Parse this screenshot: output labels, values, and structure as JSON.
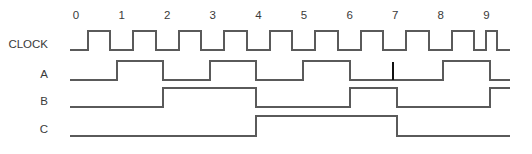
{
  "diagram": {
    "kind": "timing-waveform",
    "stroke_color": "#5a5a5a",
    "text_color": "#3a3a3a",
    "glitch_color": "#111111",
    "background_color": "#ffffff"
  },
  "time_axis": {
    "labels": [
      "0",
      "1",
      "2",
      "3",
      "4",
      "5",
      "6",
      "7",
      "8",
      "9"
    ],
    "label_y": 19,
    "origin_x": 76,
    "tick_spacing_px": 45.6
  },
  "signals": [
    {
      "name": "CLOCK",
      "label": "CLOCK",
      "label_x": 48,
      "label_y": 48,
      "baseline_y": 50,
      "high_y": 31,
      "start_x": 70,
      "end_x": 510,
      "initial_level": 0,
      "transitions": [
        {
          "x": 88,
          "level": 1
        },
        {
          "x": 110,
          "level": 0
        },
        {
          "x": 133,
          "level": 1
        },
        {
          "x": 156,
          "level": 0
        },
        {
          "x": 179,
          "level": 1
        },
        {
          "x": 201,
          "level": 0
        },
        {
          "x": 224,
          "level": 1
        },
        {
          "x": 247,
          "level": 0
        },
        {
          "x": 270,
          "level": 1
        },
        {
          "x": 292,
          "level": 0
        },
        {
          "x": 315,
          "level": 1
        },
        {
          "x": 338,
          "level": 0
        },
        {
          "x": 361,
          "level": 1
        },
        {
          "x": 383,
          "level": 0
        },
        {
          "x": 406,
          "level": 1
        },
        {
          "x": 429,
          "level": 0
        },
        {
          "x": 452,
          "level": 1
        },
        {
          "x": 474,
          "level": 0
        },
        {
          "x": 486,
          "level": 1
        },
        {
          "x": 497,
          "level": 0
        }
      ]
    },
    {
      "name": "A",
      "label": "A",
      "label_x": 48,
      "label_y": 78,
      "baseline_y": 80,
      "high_y": 61,
      "start_x": 70,
      "end_x": 510,
      "initial_level": 0,
      "transitions": [
        {
          "x": 117,
          "level": 1
        },
        {
          "x": 163,
          "level": 0
        },
        {
          "x": 210,
          "level": 1
        },
        {
          "x": 256,
          "level": 0
        },
        {
          "x": 303,
          "level": 1
        },
        {
          "x": 350,
          "level": 0
        },
        {
          "x": 443,
          "level": 1
        },
        {
          "x": 490,
          "level": 0
        }
      ],
      "glitch": {
        "x": 393,
        "y_top": 62,
        "y_bottom": 80
      }
    },
    {
      "name": "B",
      "label": "B",
      "label_x": 48,
      "label_y": 105,
      "baseline_y": 107,
      "high_y": 88,
      "start_x": 70,
      "end_x": 510,
      "initial_level": 0,
      "transitions": [
        {
          "x": 163,
          "level": 1
        },
        {
          "x": 256,
          "level": 0
        },
        {
          "x": 350,
          "level": 1
        },
        {
          "x": 397,
          "level": 0
        },
        {
          "x": 490,
          "level": 1
        }
      ]
    },
    {
      "name": "C",
      "label": "C",
      "label_x": 48,
      "label_y": 133,
      "baseline_y": 136,
      "high_y": 116,
      "start_x": 70,
      "end_x": 510,
      "initial_level": 0,
      "transitions": [
        {
          "x": 256,
          "level": 1
        },
        {
          "x": 397,
          "level": 0
        }
      ]
    }
  ]
}
